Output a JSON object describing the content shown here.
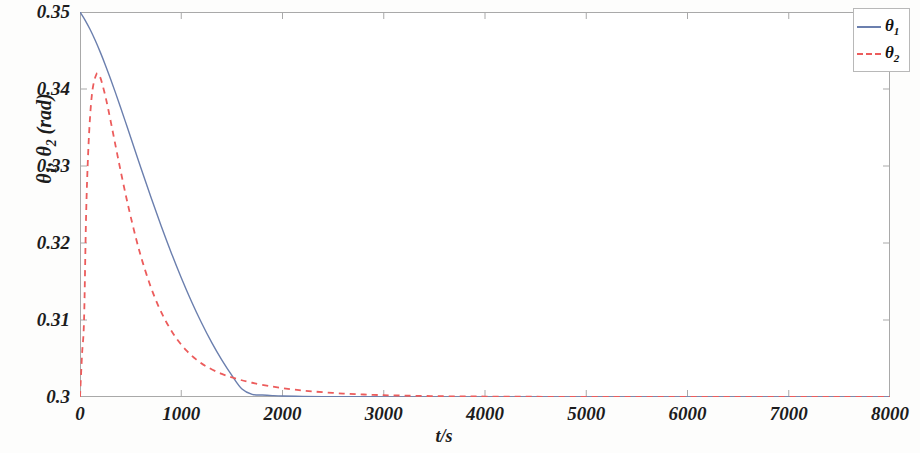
{
  "chart_data": {
    "type": "line",
    "title": "",
    "xlabel": "t/s",
    "ylabel": "θ₁, θ₂ (rad)",
    "xlim": [
      0,
      8000
    ],
    "ylim": [
      0.3,
      0.35
    ],
    "grid": false,
    "legend_position": "top-right",
    "xticks": [
      0,
      1000,
      2000,
      3000,
      4000,
      5000,
      6000,
      7000,
      8000
    ],
    "xtick_labels": [
      "0",
      "1000",
      "2000",
      "3000",
      "4000",
      "5000",
      "6000",
      "7000",
      "8000"
    ],
    "yticks": [
      0.3,
      0.31,
      0.32,
      0.33,
      0.34,
      0.35
    ],
    "ytick_labels": [
      "0.3",
      "0.31",
      "0.32",
      "0.33",
      "0.34",
      "0.35"
    ],
    "series": [
      {
        "name": "θ₁",
        "legend_label": "θ",
        "legend_sub": "1",
        "color": "#6b7fae",
        "style": "solid",
        "width": 1.4,
        "x": [
          0,
          50,
          100,
          150,
          200,
          250,
          300,
          350,
          400,
          450,
          500,
          600,
          700,
          800,
          900,
          1000,
          1100,
          1200,
          1300,
          1400,
          1500,
          1600,
          1700,
          1800,
          1900,
          2000,
          2200,
          2400,
          2600,
          2800,
          3000,
          3200,
          3400,
          3600,
          3800,
          4000,
          4400,
          4800,
          5200,
          5600,
          6000,
          6500,
          7000,
          7500,
          8000
        ],
        "y": [
          0.35,
          0.34895,
          0.34772,
          0.34633,
          0.34479,
          0.34313,
          0.34137,
          0.33953,
          0.33763,
          0.3357,
          0.33374,
          0.32981,
          0.32597,
          0.32228,
          0.31878,
          0.31549,
          0.31244,
          0.30964,
          0.30709,
          0.30482,
          0.3028,
          0.30104,
          0.30035,
          0.30025,
          0.30018,
          0.30013,
          0.30008,
          0.30005,
          0.30004,
          0.30003,
          0.30002,
          0.30002,
          0.30001,
          0.30001,
          0.30001,
          0.30001,
          0.3,
          0.3,
          0.3,
          0.3,
          0.3,
          0.3,
          0.3,
          0.3,
          0.3
        ]
      },
      {
        "name": "θ₂",
        "legend_label": "θ",
        "legend_sub": "2",
        "color": "#ec5c5c",
        "style": "dashed",
        "width": 1.8,
        "x": [
          0,
          20,
          40,
          60,
          80,
          100,
          120,
          140,
          160,
          170,
          180,
          200,
          220,
          250,
          280,
          320,
          360,
          400,
          450,
          500,
          560,
          620,
          700,
          780,
          860,
          950,
          1050,
          1150,
          1250,
          1400,
          1550,
          1700,
          1900,
          2100,
          2300,
          2600,
          2900,
          3200,
          3600,
          4000,
          4500,
          5000,
          5500,
          6000,
          6500,
          7000,
          7500,
          8000
        ],
        "y": [
          0.3,
          0.3055,
          0.31,
          0.3235,
          0.3315,
          0.3365,
          0.33955,
          0.34105,
          0.34185,
          0.34205,
          0.34195,
          0.3415,
          0.34065,
          0.3391,
          0.3373,
          0.3347,
          0.33205,
          0.32945,
          0.32635,
          0.32345,
          0.32025,
          0.31745,
          0.31425,
          0.31165,
          0.30955,
          0.30765,
          0.30605,
          0.30485,
          0.30395,
          0.303,
          0.30235,
          0.30185,
          0.30135,
          0.30098,
          0.30072,
          0.30045,
          0.30028,
          0.30018,
          0.3001,
          0.30006,
          0.30003,
          0.30002,
          0.30001,
          0.30001,
          0.3,
          0.3,
          0.3,
          0.3
        ]
      }
    ],
    "notes": {
      "theta1_description": "monotonic exponential decay from 0.35 to 0.3",
      "theta2_description": "sharp rise from 0.3 to peak ~0.342 near t=170 s, then faster exponential decay to 0.3",
      "theta2_peak_value": 0.3421,
      "theta2_peak_time": 170
    }
  },
  "axes": {
    "frame_color": "#a9a9a9",
    "background": "#ffffff"
  }
}
